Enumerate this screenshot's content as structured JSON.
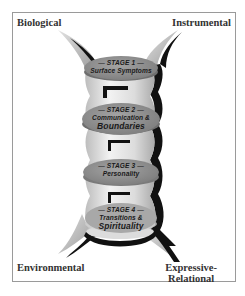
{
  "corners": {
    "top_left": "Biological",
    "top_right": "Instrumental",
    "bottom_left": "Environmental",
    "bottom_right_line1": "Expressive-",
    "bottom_right_line2": "Relational"
  },
  "stages": [
    {
      "stage": "— STAGE 1 —",
      "line1": "Surface Symptoms",
      "line2": ""
    },
    {
      "stage": "— STAGE 2 —",
      "line1": "Communication &",
      "line2": "Boundaries"
    },
    {
      "stage": "— STAGE 3 —",
      "line1": "Personality",
      "line2": ""
    },
    {
      "stage": "— STAGE 4 —",
      "line1": "Transitions &",
      "line2": "Spirituality"
    }
  ],
  "colors": {
    "disc_fill": "#8e8e8e",
    "column_light": "#e6e6e6",
    "horn_fill": "#c8c8c8",
    "shadow": "#111111",
    "frame": "#9a9a9a"
  }
}
